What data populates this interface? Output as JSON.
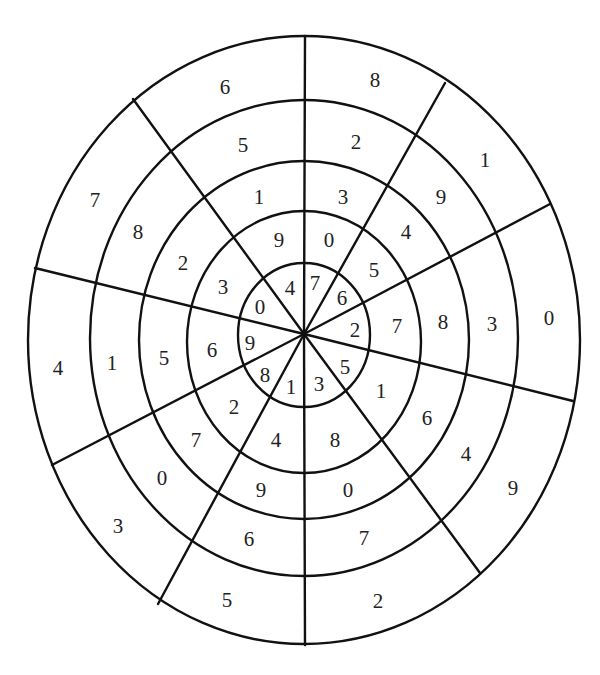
{
  "diagram": {
    "type": "number-wheel-puzzle",
    "center": [
      304,
      334
    ],
    "rings": [
      {
        "cx": 304,
        "cy": 335,
        "rx": 66,
        "ry": 72
      },
      {
        "cx": 304,
        "cy": 342,
        "rx": 117,
        "ry": 131
      },
      {
        "cx": 304,
        "cy": 340,
        "rx": 165,
        "ry": 179
      },
      {
        "cx": 304,
        "cy": 338,
        "rx": 214,
        "ry": 238
      },
      {
        "cx": 304,
        "cy": 340,
        "rx": 276,
        "ry": 304
      }
    ],
    "spokes": [
      [
        305,
        36
      ],
      [
        445,
        83
      ],
      [
        550,
        204
      ],
      [
        573,
        401
      ],
      [
        480,
        573
      ],
      [
        305,
        645
      ],
      [
        158,
        604
      ],
      [
        52,
        465
      ],
      [
        35,
        268
      ],
      [
        133,
        99
      ]
    ],
    "sectors": [
      {
        "name": "sector-1",
        "values_outer_to_inner": [
          "8",
          "2",
          "3",
          "0",
          "7"
        ],
        "positions": [
          [
            375,
            80
          ],
          [
            356,
            142
          ],
          [
            343,
            197
          ],
          [
            329,
            240
          ],
          [
            315,
            283
          ]
        ]
      },
      {
        "name": "sector-2",
        "values_outer_to_inner": [
          "1",
          "9",
          "4",
          "5",
          "6"
        ],
        "positions": [
          [
            485,
            160
          ],
          [
            441,
            197
          ],
          [
            406,
            232
          ],
          [
            374,
            270
          ],
          [
            342,
            298
          ]
        ]
      },
      {
        "name": "sector-3",
        "values_outer_to_inner": [
          "0",
          "3",
          "8",
          "7",
          "2"
        ],
        "positions": [
          [
            549,
            318
          ],
          [
            492,
            324
          ],
          [
            443,
            322
          ],
          [
            397,
            326
          ],
          [
            355,
            330
          ]
        ]
      },
      {
        "name": "sector-4",
        "values_outer_to_inner": [
          "9",
          "4",
          "6",
          "1",
          "5"
        ],
        "positions": [
          [
            513,
            488
          ],
          [
            466,
            454
          ],
          [
            427,
            418
          ],
          [
            381,
            391
          ],
          [
            345,
            367
          ]
        ]
      },
      {
        "name": "sector-5",
        "values_outer_to_inner": [
          "2",
          "7",
          "0",
          "8",
          "3"
        ],
        "positions": [
          [
            378,
            601
          ],
          [
            364,
            538
          ],
          [
            348,
            490
          ],
          [
            335,
            440
          ],
          [
            319,
            384
          ]
        ]
      },
      {
        "name": "sector-6",
        "values_outer_to_inner": [
          "5",
          "6",
          "9",
          "4",
          "1"
        ],
        "positions": [
          [
            227,
            600
          ],
          [
            249,
            539
          ],
          [
            261,
            490
          ],
          [
            276,
            440
          ],
          [
            291,
            387
          ]
        ]
      },
      {
        "name": "sector-7",
        "values_outer_to_inner": [
          "3",
          "0",
          "7",
          "2",
          "8"
        ],
        "positions": [
          [
            118,
            526
          ],
          [
            162,
            478
          ],
          [
            196,
            440
          ],
          [
            234,
            407
          ],
          [
            265,
            375
          ]
        ]
      },
      {
        "name": "sector-8",
        "values_outer_to_inner": [
          "4",
          "1",
          "5",
          "6",
          "9"
        ],
        "positions": [
          [
            58,
            368
          ],
          [
            112,
            363
          ],
          [
            164,
            358
          ],
          [
            212,
            350
          ],
          [
            250,
            343
          ]
        ]
      },
      {
        "name": "sector-9",
        "values_outer_to_inner": [
          "7",
          "8",
          "2",
          "3",
          "0"
        ],
        "positions": [
          [
            95,
            200
          ],
          [
            138,
            232
          ],
          [
            183,
            263
          ],
          [
            223,
            287
          ],
          [
            260,
            307
          ]
        ]
      },
      {
        "name": "sector-10",
        "values_outer_to_inner": [
          "6",
          "5",
          "1",
          "9",
          "4"
        ],
        "positions": [
          [
            225,
            87
          ],
          [
            243,
            145
          ],
          [
            259,
            197
          ],
          [
            279,
            240
          ],
          [
            290,
            288
          ]
        ]
      }
    ]
  }
}
